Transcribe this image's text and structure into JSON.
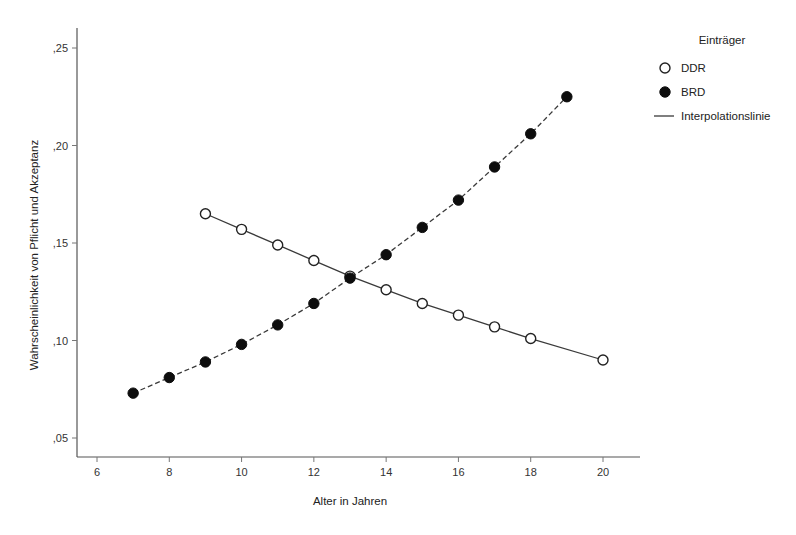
{
  "chart_data": {
    "type": "line",
    "title": "",
    "xlabel": "Alter in Jahren",
    "ylabel": "Wahrscheinlichkeit von Pflicht und Akzeptanz",
    "xlim": [
      5.2,
      21.0
    ],
    "ylim": [
      0.035,
      0.262
    ],
    "grid": false,
    "xticks": [
      6,
      8,
      10,
      12,
      14,
      16,
      18,
      20
    ],
    "xtick_labels": [
      "6",
      "8",
      "10",
      "12",
      "14",
      "16",
      "18",
      "20"
    ],
    "yticks": [
      0.05,
      0.1,
      0.15,
      0.2,
      0.25
    ],
    "ytick_labels": [
      ",05",
      ",10",
      ",15",
      ",20",
      ",25"
    ],
    "legend": {
      "title": "Einträger",
      "position": "upper-right-outside",
      "entries": [
        {
          "label": "DDR",
          "marker": "open-circle"
        },
        {
          "label": "BRD",
          "marker": "filled-circle"
        },
        {
          "label": "Interpolationslinie",
          "marker": "line"
        }
      ]
    },
    "series": [
      {
        "name": "DDR",
        "marker": "open-circle",
        "line_style": "solid",
        "x": [
          9,
          10,
          11,
          12,
          13,
          14,
          15,
          16,
          17,
          18,
          20
        ],
        "values": [
          0.165,
          0.157,
          0.149,
          0.141,
          0.133,
          0.126,
          0.119,
          0.113,
          0.107,
          0.101,
          0.09
        ]
      },
      {
        "name": "BRD",
        "marker": "filled-circle",
        "line_style": "dashed",
        "x": [
          7,
          8,
          9,
          10,
          11,
          12,
          13,
          14,
          15,
          16,
          17,
          18,
          19
        ],
        "values": [
          0.073,
          0.081,
          0.089,
          0.098,
          0.108,
          0.119,
          0.132,
          0.144,
          0.158,
          0.172,
          0.189,
          0.206,
          0.225
        ]
      }
    ],
    "colors": {
      "ddr_marker_fill": "#ffffff",
      "ddr_marker_stroke": "#222222",
      "brd_marker_fill": "#0d0d0d",
      "line": "#3a3a3a",
      "axis": "#555555",
      "background": "#ffffff"
    }
  }
}
